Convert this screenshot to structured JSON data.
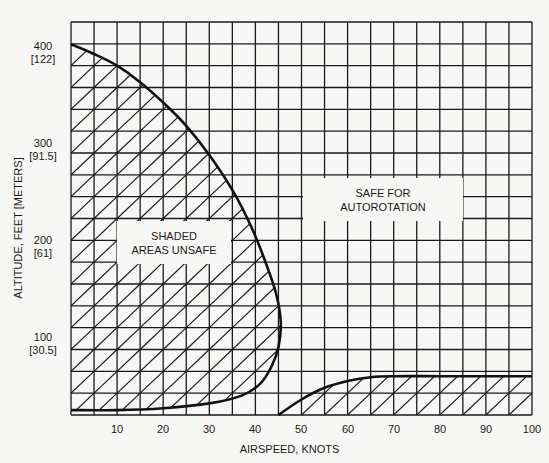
{
  "chart_data": {
    "type": "area",
    "title": "",
    "xlabel": "AIRSPEED, KNOTS",
    "ylabel": "ALTITUDE, FEET [METERS]",
    "xlim": [
      0,
      100
    ],
    "ylim": [
      0,
      405
    ],
    "grid": true,
    "x_ticks": [
      10,
      20,
      30,
      40,
      50,
      60,
      70,
      80,
      90,
      100
    ],
    "y_ticks": [
      {
        "value": 100,
        "label": "100",
        "sublabel": "[30.5]"
      },
      {
        "value": 200,
        "label": "200",
        "sublabel": "[61]"
      },
      {
        "value": 300,
        "label": "300",
        "sublabel": "[91.5]"
      },
      {
        "value": 400,
        "label": "400",
        "sublabel": "[122]"
      }
    ],
    "series": [
      {
        "name": "Low-speed avoid region boundary (shaded)",
        "points": [
          [
            0,
            382
          ],
          [
            5,
            372
          ],
          [
            10,
            360
          ],
          [
            15,
            343
          ],
          [
            20,
            322
          ],
          [
            25,
            298
          ],
          [
            30,
            268
          ],
          [
            35,
            232
          ],
          [
            39,
            195
          ],
          [
            42,
            160
          ],
          [
            44.5,
            125
          ],
          [
            45.5,
            95
          ],
          [
            45,
            70
          ],
          [
            43.5,
            50
          ],
          [
            41,
            32
          ],
          [
            37,
            20
          ],
          [
            30,
            12
          ],
          [
            20,
            7
          ],
          [
            10,
            5
          ],
          [
            0,
            5
          ]
        ]
      },
      {
        "name": "High-speed low-altitude avoid region boundary (shaded)",
        "points": [
          [
            45,
            0
          ],
          [
            50,
            16
          ],
          [
            55,
            28
          ],
          [
            60,
            35
          ],
          [
            65,
            39
          ],
          [
            70,
            40
          ],
          [
            80,
            40
          ],
          [
            90,
            40
          ],
          [
            100,
            40
          ]
        ]
      }
    ],
    "annotations": [
      {
        "text": "SHADED\nAREAS UNSAFE"
      },
      {
        "text": "SAFE FOR\nAUTOROTATION"
      }
    ]
  },
  "labels": {
    "x_title": "AIRSPEED, KNOTS",
    "y_title": "ALTITUDE, FEET [METERS]",
    "unsafe_line1": "SHADED",
    "unsafe_line2": "AREAS UNSAFE",
    "safe_line1": "SAFE FOR",
    "safe_line2": "AUTOROTATION",
    "y100": "100",
    "y100m": "[30.5]",
    "y200": "200",
    "y200m": "[61]",
    "y300": "300",
    "y300m": "[91.5]",
    "y400": "400",
    "y400m": "[122]",
    "x10": "10",
    "x20": "20",
    "x30": "30",
    "x40": "40",
    "x50": "50",
    "x60": "60",
    "x70": "70",
    "x80": "80",
    "x90": "90",
    "x100": "100"
  }
}
